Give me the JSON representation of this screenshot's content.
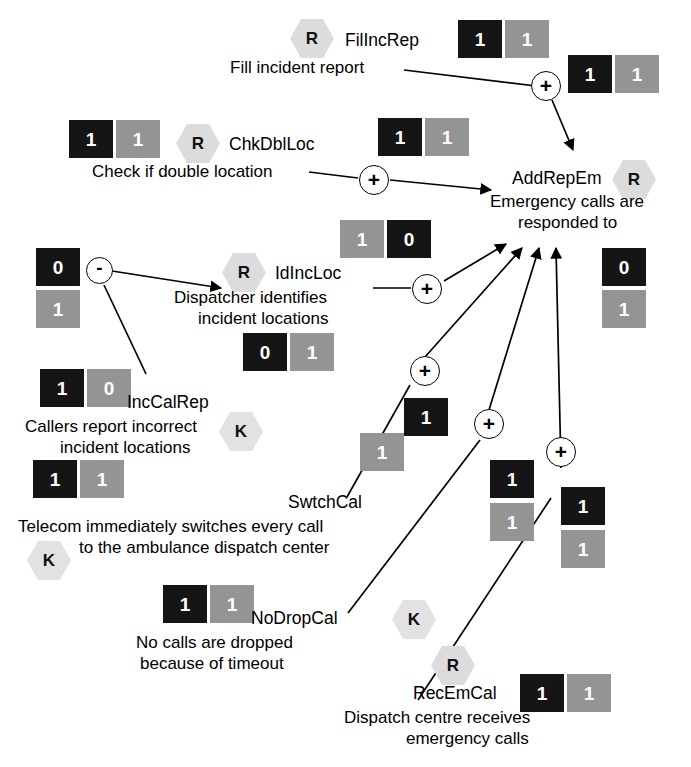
{
  "diagram": {
    "colors": {
      "black_box": "#151515",
      "gray_box": "#949494",
      "hexagon": "#dcdcdc",
      "edge": "#000000"
    },
    "nodes": [
      {
        "id": "FilIncRep",
        "badge": "R",
        "name": "FilIncRep",
        "description": "Fill incident report",
        "values": [
          "1",
          "1"
        ]
      },
      {
        "id": "ChkDblLoc",
        "badge": "R",
        "name": "ChkDblLoc",
        "description": "Check if double location",
        "values": [
          "1",
          "1"
        ]
      },
      {
        "id": "AddRepEm",
        "badge": "R",
        "name": "AddRepEm",
        "description_line1": "Emergency calls are",
        "description_line2": "responded to",
        "values": [
          "0",
          "1"
        ]
      },
      {
        "id": "IdIncLoc",
        "badge": "R",
        "name": "IdIncLoc",
        "description_line1": "Dispatcher identifies",
        "description_line2": "incident locations",
        "values": [
          "0",
          "1"
        ]
      },
      {
        "id": "IncCalRep",
        "badge": "K",
        "name": "IncCalRep",
        "description_line1": "Callers report incorrect",
        "description_line2": "incident locations",
        "values": [
          "1",
          "0"
        ]
      },
      {
        "id": "SwtchCal",
        "badge": "K",
        "name": "SwtchCal",
        "description_line1": "Telecom immediately switches every call",
        "description_line2": "to the ambulance dispatch center",
        "values": [
          "1",
          "1"
        ]
      },
      {
        "id": "NoDropCal",
        "badge": "K",
        "name": "NoDropCal",
        "description_line1": "No calls are dropped",
        "description_line2": "because of timeout",
        "values": [
          "1",
          "1"
        ]
      },
      {
        "id": "RecEmCal",
        "badge": "R",
        "name": "RecEmCal",
        "description_line1": "Dispatch centre receives",
        "description_line2": "emergency calls",
        "values": [
          "1",
          "1"
        ]
      }
    ],
    "operators": [
      {
        "id": "op-filincrep",
        "symbol": "+",
        "values": [
          "1",
          "1"
        ]
      },
      {
        "id": "op-chkdblloc",
        "symbol": "+",
        "values": [
          "1",
          "1"
        ]
      },
      {
        "id": "op-incalrep",
        "symbol": "-",
        "values": [
          "0",
          "1"
        ]
      },
      {
        "id": "op-idincloc",
        "symbol": "+",
        "values": [
          "1",
          "0"
        ]
      },
      {
        "id": "op-swtchcal",
        "symbol": "+",
        "values": [
          "1",
          "1"
        ]
      },
      {
        "id": "op-nodropcal",
        "symbol": "+",
        "values": [
          "1",
          "1"
        ]
      },
      {
        "id": "op-recemcal",
        "symbol": "+",
        "values": [
          "1",
          "1"
        ]
      }
    ]
  }
}
